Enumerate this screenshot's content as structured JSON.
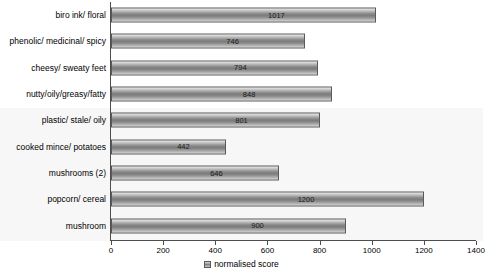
{
  "chart_data": {
    "type": "bar",
    "orientation": "horizontal",
    "title": "",
    "xlabel": "",
    "ylabel": "",
    "xlim": [
      0,
      1400
    ],
    "xticks": [
      0,
      200,
      400,
      600,
      800,
      1000,
      1200,
      1400
    ],
    "grid": false,
    "legend_position": "bottom-center",
    "legend": [
      "normalised score"
    ],
    "categories": [
      "biro ink/ floral",
      "phenolic/ medicinal/ spicy",
      "cheesy/ sweaty feet",
      "nutty/oily/greasy/fatty",
      "plastic/ stale/ oily",
      "cooked mince/ potatoes",
      "mushrooms (2)",
      "popcorn/ cereal",
      "mushroom"
    ],
    "series": [
      {
        "name": "normalised score",
        "values": [
          1017,
          746,
          794,
          848,
          801,
          442,
          646,
          1200,
          900
        ]
      }
    ],
    "colors": {
      "bar_fill_light": "#e9e9e9",
      "bar_fill_dark": "#7b7b7b",
      "bar_border": "#5a5a5a",
      "axis": "#4d4d4d",
      "plot_background": "#ffffff",
      "tint_band": "#f7f7f7",
      "text": "#000000"
    }
  }
}
